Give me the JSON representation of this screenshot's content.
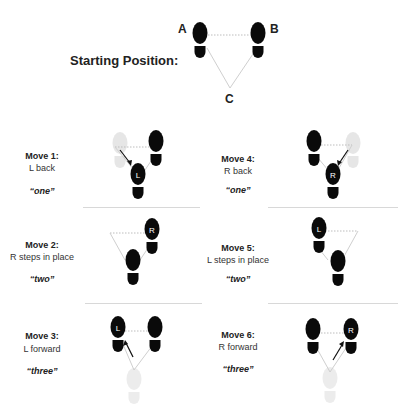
{
  "header": {
    "title": "Starting Position:",
    "points": {
      "a": "A",
      "b": "B",
      "c": "C"
    }
  },
  "moves": [
    {
      "title": "Move 1:",
      "desc": "L back",
      "count": "“one”",
      "foot_label": "L"
    },
    {
      "title": "Move 2:",
      "desc": "R steps in place",
      "count": "“two”",
      "foot_label": "R"
    },
    {
      "title": "Move 3:",
      "desc": "L forward",
      "count": "“three”",
      "foot_label": "L"
    },
    {
      "title": "Move 4:",
      "desc": "R back",
      "count": "“one”",
      "foot_label": "R"
    },
    {
      "title": "Move 5:",
      "desc": "L steps in place",
      "count": "“two”",
      "foot_label": "L"
    },
    {
      "title": "Move 6:",
      "desc": "R forward",
      "count": "“three”",
      "foot_label": "R"
    }
  ],
  "colors": {
    "shoe": "#0a0a0a",
    "ghost": "#e6e6e6",
    "guide": "#bdbdbd",
    "separator": "#d8d8d8"
  }
}
